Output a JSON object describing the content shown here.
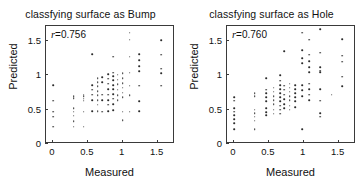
{
  "figure": {
    "background": "#ffffff",
    "point_color": "#2b2b2b",
    "axis_color": "#3a3a3a"
  },
  "chart_data": [
    {
      "type": "scatter",
      "title": "classfying surface as Bump",
      "xlabel": "Measured",
      "ylabel": "Predicted",
      "annotation": "r =0.756",
      "annotation_symbol": "r",
      "annotation_value": "=0.756",
      "correlation_r": 0.756,
      "xlim": [
        -0.1,
        1.75
      ],
      "ylim": [
        0,
        1.72
      ],
      "xticks": [
        0,
        0.5,
        1,
        1.5
      ],
      "xticklabels": [
        "0",
        "0.5",
        "1",
        "1.5"
      ],
      "yticks": [
        0,
        0.5,
        1,
        1.5
      ],
      "yticklabels": [
        "0",
        "0.5",
        "1",
        "1.5"
      ],
      "grid": false,
      "legend": "none",
      "marker": "dot",
      "points": [
        [
          0.0,
          0.86
        ],
        [
          0.0,
          0.63
        ],
        [
          0.0,
          0.47
        ],
        [
          0.0,
          0.4
        ],
        [
          0.0,
          0.25
        ],
        [
          0.3,
          0.7
        ],
        [
          0.3,
          0.67
        ],
        [
          0.3,
          0.52
        ],
        [
          0.3,
          0.47
        ],
        [
          0.3,
          0.41
        ],
        [
          0.3,
          0.33
        ],
        [
          0.3,
          0.25
        ],
        [
          0.44,
          0.72
        ],
        [
          0.44,
          0.7
        ],
        [
          0.44,
          0.66
        ],
        [
          0.44,
          0.63
        ],
        [
          0.44,
          0.47
        ],
        [
          0.44,
          0.25
        ],
        [
          0.56,
          1.31
        ],
        [
          0.56,
          0.86
        ],
        [
          0.56,
          0.79
        ],
        [
          0.56,
          0.72
        ],
        [
          0.56,
          0.64
        ],
        [
          0.56,
          0.48
        ],
        [
          0.64,
          0.96
        ],
        [
          0.64,
          0.9
        ],
        [
          0.64,
          0.84
        ],
        [
          0.64,
          0.77
        ],
        [
          0.64,
          0.71
        ],
        [
          0.64,
          0.64
        ],
        [
          0.64,
          0.57
        ],
        [
          0.64,
          0.48
        ],
        [
          0.71,
          0.97
        ],
        [
          0.71,
          0.9
        ],
        [
          0.71,
          0.72
        ],
        [
          0.71,
          0.64
        ],
        [
          0.71,
          0.47
        ],
        [
          0.79,
          1.02
        ],
        [
          0.79,
          0.95
        ],
        [
          0.79,
          0.88
        ],
        [
          0.79,
          0.8
        ],
        [
          0.79,
          0.72
        ],
        [
          0.79,
          0.64
        ],
        [
          0.79,
          0.57
        ],
        [
          0.79,
          0.48
        ],
        [
          0.86,
          1.27
        ],
        [
          0.86,
          1.04
        ],
        [
          0.86,
          0.99
        ],
        [
          0.86,
          0.93
        ],
        [
          0.86,
          0.86
        ],
        [
          0.86,
          0.8
        ],
        [
          0.86,
          0.73
        ],
        [
          0.86,
          0.66
        ],
        [
          0.86,
          0.58
        ],
        [
          0.86,
          0.49
        ],
        [
          0.93,
          1.01
        ],
        [
          0.93,
          0.94
        ],
        [
          0.93,
          0.87
        ],
        [
          0.93,
          0.79
        ],
        [
          0.93,
          0.71
        ],
        [
          0.93,
          0.64
        ],
        [
          1.0,
          1.03
        ],
        [
          1.0,
          0.96
        ],
        [
          1.0,
          0.89
        ],
        [
          1.0,
          0.82
        ],
        [
          1.0,
          0.75
        ],
        [
          1.0,
          0.68
        ],
        [
          1.0,
          0.47
        ],
        [
          1.0,
          0.35
        ],
        [
          1.1,
          1.62
        ],
        [
          1.1,
          1.52
        ],
        [
          1.1,
          1.27
        ],
        [
          1.1,
          1.04
        ],
        [
          1.1,
          0.85
        ],
        [
          1.1,
          0.71
        ],
        [
          1.1,
          0.47
        ],
        [
          1.24,
          1.31
        ],
        [
          1.24,
          1.22
        ],
        [
          1.24,
          1.13
        ],
        [
          1.24,
          1.06
        ],
        [
          1.24,
          0.85
        ],
        [
          1.24,
          0.62
        ],
        [
          1.24,
          0.48
        ],
        [
          1.55,
          1.51
        ],
        [
          1.55,
          1.3
        ],
        [
          1.55,
          1.1
        ],
        [
          1.55,
          1.03
        ],
        [
          1.55,
          0.85
        ]
      ]
    },
    {
      "type": "scatter",
      "title": "classfying surface as Hole",
      "xlabel": "Measured",
      "ylabel": "Predicted",
      "annotation": "r =0.760",
      "annotation_symbol": "r",
      "annotation_value": "=0.760",
      "correlation_r": 0.76,
      "xlim": [
        -0.1,
        1.75
      ],
      "ylim": [
        0,
        1.72
      ],
      "xticks": [
        0,
        0.5,
        1,
        1.5
      ],
      "xticklabels": [
        "0",
        "0.5",
        "1",
        "1.5"
      ],
      "yticks": [
        0,
        0.5,
        1,
        1.5
      ],
      "yticklabels": [
        "0",
        "0.5",
        "1",
        "1.5"
      ],
      "grid": false,
      "legend": "none",
      "marker": "dot",
      "points": [
        [
          0.0,
          0.68
        ],
        [
          0.0,
          0.63
        ],
        [
          0.0,
          0.52
        ],
        [
          0.0,
          0.47
        ],
        [
          0.0,
          0.42
        ],
        [
          0.0,
          0.36
        ],
        [
          0.0,
          0.3
        ],
        [
          0.0,
          0.22
        ],
        [
          0.3,
          0.74
        ],
        [
          0.3,
          0.7
        ],
        [
          0.3,
          0.5
        ],
        [
          0.3,
          0.45
        ],
        [
          0.3,
          0.4
        ],
        [
          0.3,
          0.34
        ],
        [
          0.3,
          0.22
        ],
        [
          0.46,
          0.96
        ],
        [
          0.46,
          0.79
        ],
        [
          0.46,
          0.74
        ],
        [
          0.46,
          0.68
        ],
        [
          0.46,
          0.62
        ],
        [
          0.46,
          0.52
        ],
        [
          0.46,
          0.46
        ],
        [
          0.46,
          0.42
        ],
        [
          0.57,
          0.82
        ],
        [
          0.57,
          0.76
        ],
        [
          0.57,
          0.7
        ],
        [
          0.57,
          0.64
        ],
        [
          0.57,
          0.58
        ],
        [
          0.57,
          0.5
        ],
        [
          0.57,
          0.44
        ],
        [
          0.66,
          1.0
        ],
        [
          0.66,
          0.92
        ],
        [
          0.66,
          0.86
        ],
        [
          0.66,
          0.8
        ],
        [
          0.66,
          0.74
        ],
        [
          0.66,
          0.68
        ],
        [
          0.66,
          0.62
        ],
        [
          0.66,
          0.56
        ],
        [
          0.66,
          0.5
        ],
        [
          0.66,
          0.44
        ],
        [
          0.72,
          1.35
        ],
        [
          0.72,
          0.85
        ],
        [
          0.72,
          0.79
        ],
        [
          0.72,
          0.72
        ],
        [
          0.72,
          0.65
        ],
        [
          0.72,
          0.58
        ],
        [
          0.72,
          0.52
        ],
        [
          0.8,
          0.88
        ],
        [
          0.8,
          0.82
        ],
        [
          0.8,
          0.76
        ],
        [
          0.8,
          0.7
        ],
        [
          0.8,
          0.64
        ],
        [
          0.8,
          0.56
        ],
        [
          0.8,
          0.5
        ],
        [
          0.88,
          0.86
        ],
        [
          0.88,
          0.8
        ],
        [
          0.88,
          0.74
        ],
        [
          0.88,
          0.68
        ],
        [
          0.88,
          0.62
        ],
        [
          0.88,
          0.54
        ],
        [
          0.98,
          1.62
        ],
        [
          0.98,
          1.37
        ],
        [
          0.98,
          1.25
        ],
        [
          0.98,
          1.18
        ],
        [
          0.98,
          0.86
        ],
        [
          0.98,
          0.78
        ],
        [
          0.98,
          0.7
        ],
        [
          0.98,
          0.22
        ],
        [
          1.08,
          1.52
        ],
        [
          1.08,
          1.3
        ],
        [
          1.08,
          1.21
        ],
        [
          1.08,
          1.12
        ],
        [
          1.08,
          1.05
        ],
        [
          1.08,
          0.88
        ],
        [
          1.08,
          0.8
        ],
        [
          1.08,
          0.72
        ],
        [
          1.08,
          0.64
        ],
        [
          1.24,
          1.67
        ],
        [
          1.24,
          1.33
        ],
        [
          1.24,
          1.12
        ],
        [
          1.24,
          1.07
        ],
        [
          1.24,
          1.05
        ],
        [
          1.24,
          0.8
        ],
        [
          1.24,
          0.63
        ],
        [
          1.24,
          0.45
        ],
        [
          1.24,
          0.4
        ],
        [
          1.4,
          0.72
        ],
        [
          1.55,
          1.53
        ],
        [
          1.55,
          1.29
        ],
        [
          1.55,
          1.2
        ],
        [
          1.55,
          0.98
        ],
        [
          1.55,
          0.84
        ]
      ]
    }
  ]
}
